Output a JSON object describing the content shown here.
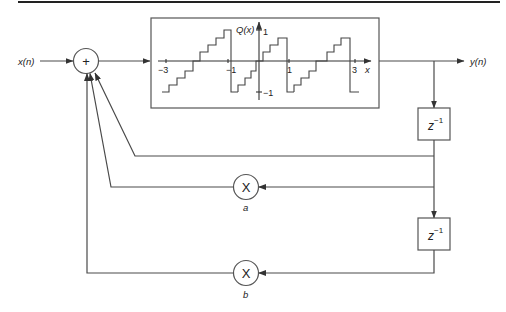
{
  "diagram": {
    "input_label": "x(n)",
    "output_label": "y(n)",
    "summer": {
      "symbol": "+"
    },
    "quantizer": {
      "y_label": "Q(x)",
      "x_label": "x",
      "x_ticks": [
        "−3",
        "−1",
        "1",
        "3"
      ],
      "y_ticks": [
        "1",
        "−1"
      ],
      "characteristic": "sawtooth staircase (two's-complement overflow with quantization)"
    },
    "delays": [
      {
        "label": "z",
        "exponent": "−1"
      },
      {
        "label": "z",
        "exponent": "−1"
      }
    ],
    "multipliers": [
      {
        "symbol": "X",
        "coefficient": "a"
      },
      {
        "symbol": "X",
        "coefficient": "b"
      }
    ],
    "feedback_paths": [
      "direct from y(n-1) branch",
      "via multiplier a",
      "via multiplier b"
    ]
  },
  "colors": {
    "line": "#4a4a4a",
    "background": "#ffffff",
    "text": "#222222"
  }
}
